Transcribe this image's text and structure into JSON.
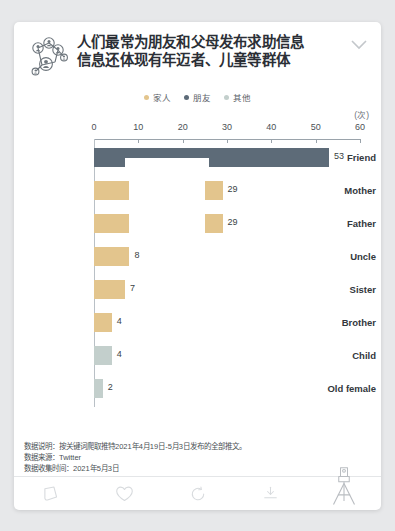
{
  "card": {
    "brand_icon": "people-network-icon",
    "collapse_icon": "chevron-down-icon",
    "title_line1": "人们最常为朋友和父母发布求助信息",
    "title_line2": "信息还体现有年迈者、儿童等群体"
  },
  "legend": {
    "items": [
      {
        "label": "家人",
        "color": "#e3c58d",
        "icon": "legend-dot"
      },
      {
        "label": "朋友",
        "color": "#5d6b78",
        "icon": "legend-dot"
      },
      {
        "label": "其他",
        "color": "#c3cfcc",
        "icon": "legend-dot"
      }
    ]
  },
  "chart_data": {
    "type": "bar",
    "orientation": "horizontal",
    "title": "人们最常为朋友和父母发布求助信息",
    "subtitle": "信息还体现有年迈者、儿童等群体",
    "unit_label": "(次)",
    "xlabel": "",
    "ylabel": "",
    "xlim": [
      0,
      60
    ],
    "xticks": [
      0,
      10,
      20,
      30,
      40,
      50,
      60
    ],
    "grid": false,
    "legend_position": "top-center",
    "categories": [
      "Friend",
      "Mother",
      "Father",
      "Uncle",
      "Sister",
      "Brother",
      "Child",
      "Old female"
    ],
    "values": [
      53,
      29,
      29,
      8,
      7,
      4,
      4,
      2
    ],
    "value_labels": [
      "53",
      "29",
      "29",
      "8",
      "7",
      "4",
      "4",
      "2"
    ],
    "groups": [
      "朋友",
      "家人",
      "家人",
      "家人",
      "家人",
      "家人",
      "其他",
      "其他"
    ],
    "colors": [
      "#5d6b78",
      "#e3c58d",
      "#e3c58d",
      "#e3c58d",
      "#e3c58d",
      "#e3c58d",
      "#c3cfcc",
      "#c3cfcc"
    ]
  },
  "footnotes": {
    "lines": [
      "数据说明：按关键词爬取推特2021年4月19日-5月3日发布的全部推文。",
      "数据来源：Twitter",
      "数据收集时间：2021年5月3日"
    ]
  },
  "toolbar": {
    "items": [
      {
        "name": "comment-icon",
        "label": ""
      },
      {
        "name": "heart-icon",
        "label": ""
      },
      {
        "name": "refresh-icon",
        "label": ""
      },
      {
        "name": "download-icon",
        "label": ""
      },
      {
        "name": "camera-tripod-icon",
        "label": ""
      }
    ]
  }
}
